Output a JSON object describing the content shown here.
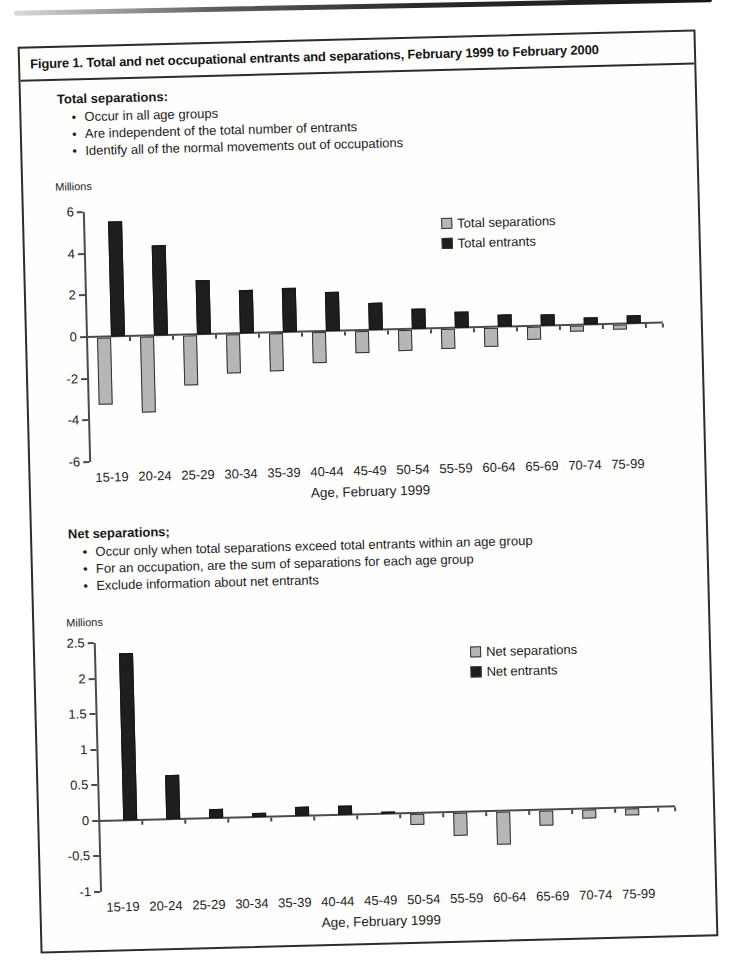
{
  "figure": {
    "title": "Figure 1.  Total and net occupational entrants and separations, February 1999 to February 2000"
  },
  "sections": [
    {
      "heading": "Total separations:",
      "bullets": [
        "Occur in all age groups",
        "Are independent of the total number of entrants",
        "Identify all of the normal movements out of occupations"
      ]
    },
    {
      "heading": "Net separations;",
      "bullets": [
        "Occur only when total separations exceed total entrants within an age group",
        "For an occupation, are the sum of separations for each age group",
        "Exclude information about net entrants"
      ]
    }
  ],
  "colors": {
    "separations": "#b6b6b6",
    "entrants": "#1e1e1e",
    "axis": "#4a4a4a",
    "bar_border": "#2f2f2f",
    "box_border": "#2c2c2c"
  },
  "chart_data": [
    {
      "type": "bar",
      "title": "Total entrants and separations by age group",
      "units_label": "Millions",
      "xlabel": "Age, February 1999",
      "ylabel": "Millions",
      "categories": [
        "15-19",
        "20-24",
        "25-29",
        "30-34",
        "35-39",
        "40-44",
        "45-49",
        "50-54",
        "55-59",
        "60-64",
        "65-69",
        "70-74",
        "75-99"
      ],
      "series": [
        {
          "name": "Total separations",
          "color_key": "separations",
          "values": [
            -3.2,
            -3.65,
            -2.4,
            -1.85,
            -1.8,
            -1.5,
            -1.05,
            -1.0,
            -0.95,
            -0.9,
            -0.6,
            -0.3,
            -0.25
          ]
        },
        {
          "name": "Total entrants",
          "color_key": "entrants",
          "values": [
            5.5,
            4.3,
            2.6,
            2.05,
            2.1,
            1.85,
            1.3,
            0.95,
            0.75,
            0.6,
            0.55,
            0.35,
            0.4
          ]
        }
      ],
      "ylim": [
        -6,
        6
      ],
      "yticks": [
        6,
        4,
        2,
        0,
        -2,
        -4,
        -6
      ],
      "legend_position": "upper right",
      "grid": false
    },
    {
      "type": "bar",
      "title": "Net entrants and separations by age group",
      "units_label": "Millions",
      "xlabel": "Age, February 1999",
      "ylabel": "Millions",
      "categories": [
        "15-19",
        "20-24",
        "25-29",
        "30-34",
        "35-39",
        "40-44",
        "45-49",
        "50-54",
        "55-59",
        "60-64",
        "65-69",
        "70-74",
        "75-99"
      ],
      "series": [
        {
          "name": "Net separations",
          "color_key": "separations",
          "values": [
            0,
            0,
            0,
            0,
            0,
            0,
            0,
            -0.15,
            -0.32,
            -0.47,
            -0.22,
            -0.13,
            -0.1
          ]
        },
        {
          "name": "Net entrants",
          "color_key": "entrants",
          "values": [
            2.35,
            0.62,
            0.13,
            0.06,
            0.13,
            0.12,
            0.03,
            0,
            0,
            0,
            0,
            0,
            0
          ]
        }
      ],
      "ylim": [
        -1,
        2.5
      ],
      "yticks": [
        2.5,
        2,
        1.5,
        1,
        0.5,
        0,
        -0.5,
        -1
      ],
      "legend_position": "upper right",
      "grid": false
    }
  ]
}
